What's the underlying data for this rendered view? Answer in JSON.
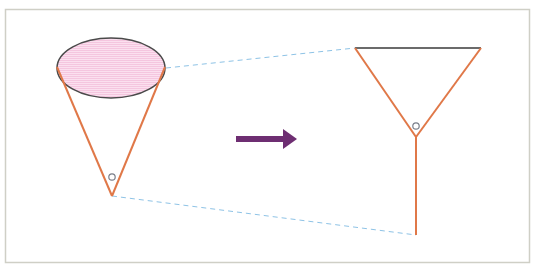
{
  "diagram": {
    "colors": {
      "frame": "#cfcfc6",
      "cone_edge": "#e07848",
      "ellipse_fill": "#f8d4e8",
      "ellipse_stroke": "#4a4a4a",
      "dash": "#8ec3e6",
      "arrow": "#6e2e72",
      "marker": "#7a7f8a",
      "top_line": "#3a3a3a"
    },
    "left_figure": {
      "name": "cone",
      "ellipse": {
        "cx": 111,
        "cy": 68,
        "rx": 54,
        "ry": 30
      },
      "apex": [
        112,
        196
      ],
      "marker_circle": [
        112,
        177
      ]
    },
    "arrow": {
      "from": [
        236,
        139
      ],
      "to": [
        297,
        139
      ],
      "direction": "right"
    },
    "right_figure": {
      "name": "triangle-with-stem",
      "top_left": [
        355,
        48
      ],
      "top_right": [
        481,
        48
      ],
      "apex": [
        416,
        137
      ],
      "marker_circle": [
        416,
        126
      ],
      "stem_end": [
        416,
        235
      ]
    },
    "connectors": [
      {
        "from": [
          166,
          68
        ],
        "to": [
          355,
          48
        ],
        "style": "dashed"
      },
      {
        "from": [
          112,
          196
        ],
        "to": [
          416,
          235
        ],
        "style": "dashed"
      }
    ]
  }
}
